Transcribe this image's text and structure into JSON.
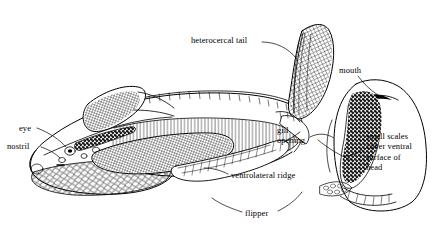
{
  "figure": {
    "kind": "scientific-line-illustration",
    "background_color": "#ffffff",
    "ink_color": "#000000",
    "views": [
      {
        "name": "lateral-view",
        "description": "whole fish, head at right, heterocercal tail at left"
      },
      {
        "name": "ventral-head-view",
        "description": "underside of head at far right"
      }
    ]
  },
  "labels": {
    "heterocercal_tail": "heterocercal tail",
    "mouth": "mouth",
    "eye": "eye",
    "nostril": "nostril",
    "gill_opening": "gill\nopening",
    "small_scales": "small scales\ncover ventral\nsurface of\nhead",
    "ventrolateral_ridge": "ventrolateral ridge",
    "flipper": "flipper"
  }
}
